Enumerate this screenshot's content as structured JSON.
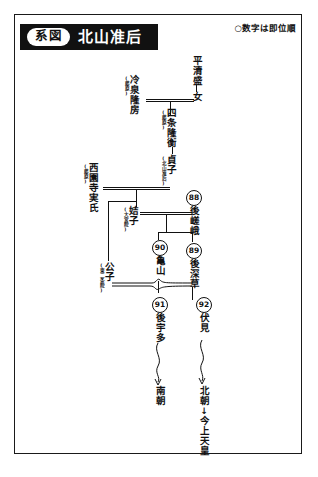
{
  "page": {
    "title_tag": "系図",
    "title_main": "北山准后",
    "legend": "○数字は即位順"
  },
  "nodes": {
    "taira_kiyomori": {
      "name": "平清盛",
      "annot": ""
    },
    "musume": {
      "name": "女",
      "annot": ""
    },
    "reizei_takafusa": {
      "name": "冷泉隆房",
      "annot": "(藤原)"
    },
    "shijo_takahira": {
      "name": "四条隆衡",
      "annot": "(藤原)"
    },
    "teishi": {
      "name": "貞子",
      "annot": "(北山准后)"
    },
    "saionji_saneuji": {
      "name": "西園寺実氏",
      "annot": "(藤原)"
    },
    "kitsushi": {
      "name": "姞子",
      "annot": "(大宮院)"
    },
    "kinshi": {
      "name": "公子",
      "annot": "(東二条院)"
    },
    "gosaga": {
      "name": "後嵯峨",
      "number": "88"
    },
    "kameyama": {
      "name": "亀山",
      "number": "90"
    },
    "gofukakusa": {
      "name": "後深草",
      "number": "89"
    },
    "gouda": {
      "name": "後宇多",
      "number": "91"
    },
    "fushimi": {
      "name": "伏見",
      "number": "92"
    },
    "nancho": {
      "name": "南朝",
      "annot": ""
    },
    "hokucho": {
      "name": "北朝",
      "annot": ""
    },
    "kinjo_tenno": {
      "name": "今上天皇",
      "annot": ""
    }
  },
  "arrows": {
    "down": "↓"
  },
  "colors": {
    "ink": "#111111",
    "paper": "#ffffff",
    "banner": "#111111"
  }
}
